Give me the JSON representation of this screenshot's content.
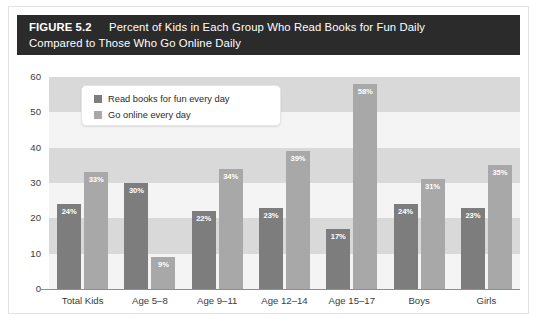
{
  "figure": {
    "label": "FIGURE 5.2",
    "title_line1": "Percent of Kids in Each Group Who Read Books for Fun Daily",
    "title_line2": "Compared to Those Who Go Online Daily"
  },
  "legend": {
    "items": [
      {
        "label": "Read books for fun every day",
        "color": "#7d7d7d"
      },
      {
        "label": "Go online every day",
        "color": "#a8a8a8"
      }
    ]
  },
  "chart_data": {
    "type": "bar",
    "title": "Percent of Kids in Each Group Who Read Books for Fun Daily Compared to Those Who Go Online Daily",
    "xlabel": "",
    "ylabel": "",
    "ylim": [
      0,
      60
    ],
    "yticks": [
      0,
      10,
      20,
      30,
      40,
      50,
      60
    ],
    "ytick_labels": [
      "0",
      "10",
      "20",
      "30",
      "40",
      "50",
      "60"
    ],
    "grid": "alternating-horizontal-bands",
    "legend_position": "top-left-inside",
    "categories": [
      "Total Kids",
      "Age 5–8",
      "Age 9–11",
      "Age 12–14",
      "Age 15–17",
      "Boys",
      "Girls"
    ],
    "series": [
      {
        "name": "Read books for fun every day",
        "color": "#7d7d7d",
        "values": [
          24,
          30,
          22,
          23,
          17,
          24,
          23
        ],
        "labels": [
          "24%",
          "30%",
          "22%",
          "23%",
          "17%",
          "24%",
          "23%"
        ]
      },
      {
        "name": "Go online every day",
        "color": "#a8a8a8",
        "values": [
          33,
          9,
          34,
          39,
          58,
          31,
          35
        ],
        "labels": [
          "33%",
          "9%",
          "34%",
          "39%",
          "58%",
          "31%",
          "35%"
        ]
      }
    ]
  }
}
